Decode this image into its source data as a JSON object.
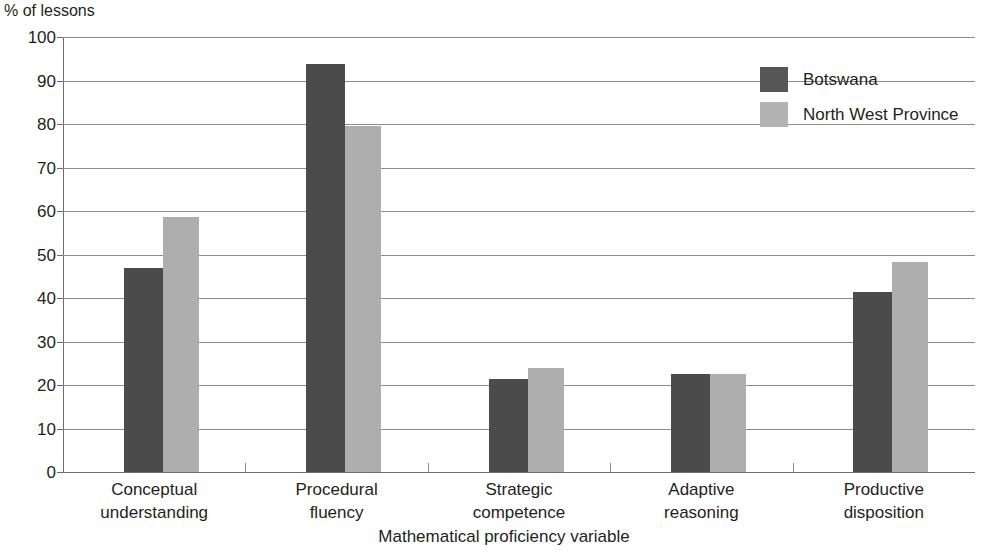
{
  "chart_data": {
    "type": "bar",
    "title": "",
    "subtitle": "",
    "ylabel": "% of lessons",
    "xlabel": "Mathematical proficiency variable",
    "ylim": [
      0,
      100
    ],
    "ytick_step": 10,
    "yticks": [
      "100",
      "90",
      "80",
      "70",
      "60",
      "50",
      "40",
      "30",
      "20",
      "10",
      "0"
    ],
    "grid": true,
    "legend_position": "top-right",
    "categories": [
      "Conceptual\nunderstanding",
      "Procedural\nfluency",
      "Strategic\ncompetence",
      "Adaptive\nreasoning",
      "Productive\ndisposition"
    ],
    "category_lines": [
      [
        "Conceptual",
        "understanding"
      ],
      [
        "Procedural",
        "fluency"
      ],
      [
        "Strategic",
        "competence"
      ],
      [
        "Adaptive",
        "reasoning"
      ],
      [
        "Productive",
        "disposition"
      ]
    ],
    "series": [
      {
        "name": "Botswana",
        "color": "#4b4b4b",
        "values": [
          47.0,
          93.7,
          21.4,
          22.5,
          41.4
        ]
      },
      {
        "name": "North West Province",
        "color": "#aeaeae",
        "values": [
          58.6,
          79.5,
          23.9,
          22.5,
          48.3
        ]
      }
    ]
  },
  "legend": {
    "items": [
      {
        "label": "Botswana",
        "color": "#4b4b4b"
      },
      {
        "label": "North West Province",
        "color": "#aeaeae"
      }
    ]
  },
  "axes": {
    "y_title": "% of lessons",
    "x_title": "Mathematical proficiency variable"
  }
}
